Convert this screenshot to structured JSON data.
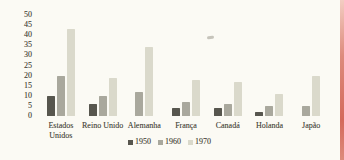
{
  "chart_data": {
    "type": "bar",
    "title": "",
    "xlabel": "",
    "ylabel": "",
    "categories": [
      "Estados Unidos",
      "Reino Unido",
      "Alemanha",
      "França",
      "Canadá",
      "Holanda",
      "Japão"
    ],
    "series": [
      {
        "name": "1950",
        "color": "#57564e",
        "values": [
          10,
          6,
          null,
          4,
          4,
          2,
          null
        ]
      },
      {
        "name": "1960",
        "color": "#a9a89d",
        "values": [
          20,
          10,
          12,
          7,
          6,
          5,
          5
        ]
      },
      {
        "name": "1970",
        "color": "#dad9cb",
        "values": [
          43,
          19,
          34,
          18,
          17,
          11,
          20
        ]
      }
    ],
    "ylim": [
      0,
      50
    ],
    "yticks": [
      50,
      45,
      40,
      35,
      30,
      25,
      20,
      15,
      10,
      5,
      0
    ],
    "grid": false,
    "legend_position": "bottom-center"
  },
  "style": {
    "background": "#fbfaf4",
    "text_color": "#4b4a41",
    "scan_edge_top": "#f3cdc2",
    "scan_edge_mid": "#dd8b7c",
    "scan_edge_bottom": "#d4695b"
  }
}
